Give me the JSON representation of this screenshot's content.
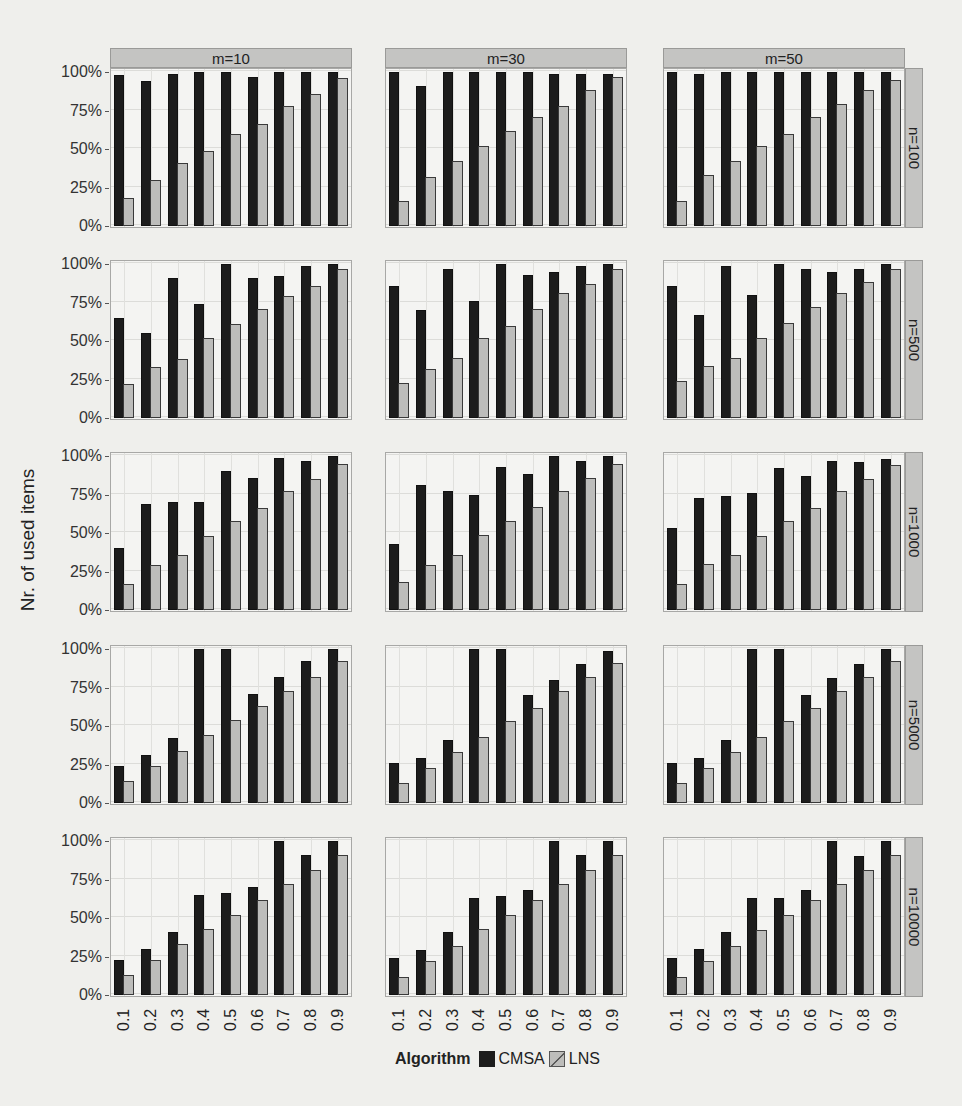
{
  "chart_data": {
    "type": "bar",
    "layout": "facet_grid",
    "title": "",
    "xlabel": "",
    "ylabel": "Nr. of used items",
    "y_tick_labels": [
      "0%",
      "25%",
      "50%",
      "75%",
      "100%"
    ],
    "ylim": [
      0,
      100
    ],
    "categories": [
      "0.1",
      "0.2",
      "0.3",
      "0.4",
      "0.5",
      "0.6",
      "0.7",
      "0.8",
      "0.9"
    ],
    "facet_columns": [
      "m=10",
      "m=30",
      "m=50"
    ],
    "facet_rows": [
      "n=100",
      "n=500",
      "n=1000",
      "n=5000",
      "n=10000"
    ],
    "legend": {
      "title": "Algorithm",
      "entries": [
        "CMSA",
        "LNS"
      ],
      "position": "bottom"
    },
    "grid": true,
    "panels": [
      {
        "row": "n=100",
        "col": "m=10",
        "series": [
          {
            "name": "CMSA",
            "values": [
              98,
              94,
              99,
              100,
              100,
              97,
              100,
              100,
              100
            ]
          },
          {
            "name": "LNS",
            "values": [
              18,
              30,
              41,
              49,
              60,
              66,
              78,
              86,
              96
            ]
          }
        ]
      },
      {
        "row": "n=100",
        "col": "m=30",
        "series": [
          {
            "name": "CMSA",
            "values": [
              100,
              91,
              100,
              100,
              100,
              100,
              99,
              99,
              99
            ]
          },
          {
            "name": "LNS",
            "values": [
              16,
              32,
              42,
              52,
              62,
              71,
              78,
              88,
              97
            ]
          }
        ]
      },
      {
        "row": "n=100",
        "col": "m=50",
        "series": [
          {
            "name": "CMSA",
            "values": [
              100,
              99,
              100,
              100,
              100,
              100,
              100,
              100,
              100
            ]
          },
          {
            "name": "LNS",
            "values": [
              16,
              33,
              42,
              52,
              60,
              71,
              79,
              88,
              95
            ]
          }
        ]
      },
      {
        "row": "n=500",
        "col": "m=10",
        "series": [
          {
            "name": "CMSA",
            "values": [
              65,
              55,
              91,
              74,
              100,
              91,
              92,
              99,
              100
            ]
          },
          {
            "name": "LNS",
            "values": [
              22,
              33,
              38,
              52,
              61,
              71,
              79,
              86,
              97
            ]
          }
        ]
      },
      {
        "row": "n=500",
        "col": "m=30",
        "series": [
          {
            "name": "CMSA",
            "values": [
              86,
              70,
              97,
              76,
              100,
              93,
              95,
              99,
              100
            ]
          },
          {
            "name": "LNS",
            "values": [
              23,
              32,
              39,
              52,
              60,
              71,
              81,
              87,
              97
            ]
          }
        ]
      },
      {
        "row": "n=500",
        "col": "m=50",
        "series": [
          {
            "name": "CMSA",
            "values": [
              86,
              67,
              99,
              80,
              100,
              97,
              95,
              97,
              100
            ]
          },
          {
            "name": "LNS",
            "values": [
              24,
              34,
              39,
              52,
              62,
              72,
              81,
              88,
              97
            ]
          }
        ]
      },
      {
        "row": "n=1000",
        "col": "m=10",
        "series": [
          {
            "name": "CMSA",
            "values": [
              40,
              69,
              70,
              70,
              90,
              86,
              99,
              97,
              100
            ]
          },
          {
            "name": "LNS",
            "values": [
              17,
              29,
              36,
              48,
              58,
              66,
              77,
              85,
              95
            ]
          }
        ]
      },
      {
        "row": "n=1000",
        "col": "m=30",
        "series": [
          {
            "name": "CMSA",
            "values": [
              43,
              81,
              77,
              75,
              93,
              88,
              100,
              97,
              100
            ]
          },
          {
            "name": "LNS",
            "values": [
              18,
              29,
              36,
              49,
              58,
              67,
              77,
              86,
              95
            ]
          }
        ]
      },
      {
        "row": "n=1000",
        "col": "m=50",
        "series": [
          {
            "name": "CMSA",
            "values": [
              53,
              73,
              74,
              76,
              92,
              87,
              97,
              96,
              98
            ]
          },
          {
            "name": "LNS",
            "values": [
              17,
              30,
              36,
              48,
              58,
              66,
              77,
              85,
              94
            ]
          }
        ]
      },
      {
        "row": "n=5000",
        "col": "m=10",
        "series": [
          {
            "name": "CMSA",
            "values": [
              24,
              31,
              42,
              100,
              100,
              71,
              82,
              92,
              100
            ]
          },
          {
            "name": "LNS",
            "values": [
              14,
              24,
              34,
              44,
              54,
              63,
              73,
              82,
              92
            ]
          }
        ]
      },
      {
        "row": "n=5000",
        "col": "m=30",
        "series": [
          {
            "name": "CMSA",
            "values": [
              26,
              29,
              41,
              100,
              100,
              70,
              80,
              90,
              99
            ]
          },
          {
            "name": "LNS",
            "values": [
              13,
              23,
              33,
              43,
              53,
              62,
              73,
              82,
              91
            ]
          }
        ]
      },
      {
        "row": "n=5000",
        "col": "m=50",
        "series": [
          {
            "name": "CMSA",
            "values": [
              26,
              29,
              41,
              100,
              100,
              70,
              81,
              90,
              100
            ]
          },
          {
            "name": "LNS",
            "values": [
              13,
              23,
              33,
              43,
              53,
              62,
              73,
              82,
              92
            ]
          }
        ]
      },
      {
        "row": "n=10000",
        "col": "m=10",
        "series": [
          {
            "name": "CMSA",
            "values": [
              23,
              30,
              41,
              65,
              66,
              70,
              100,
              91,
              100
            ]
          },
          {
            "name": "LNS",
            "values": [
              13,
              23,
              33,
              43,
              52,
              62,
              72,
              81,
              91
            ]
          }
        ]
      },
      {
        "row": "n=10000",
        "col": "m=30",
        "series": [
          {
            "name": "CMSA",
            "values": [
              24,
              29,
              41,
              63,
              64,
              68,
              100,
              91,
              100
            ]
          },
          {
            "name": "LNS",
            "values": [
              12,
              22,
              32,
              43,
              52,
              62,
              72,
              81,
              91
            ]
          }
        ]
      },
      {
        "row": "n=10000",
        "col": "m=50",
        "series": [
          {
            "name": "CMSA",
            "values": [
              24,
              30,
              41,
              63,
              63,
              68,
              100,
              90,
              100
            ]
          },
          {
            "name": "LNS",
            "values": [
              12,
              22,
              32,
              42,
              52,
              62,
              72,
              81,
              91
            ]
          }
        ]
      }
    ]
  },
  "colors": {
    "cmsa": "#1c1c1c",
    "lns": "#bdbdbb",
    "strip": "#c4c4c2",
    "panel_bg": "#f4f4f2"
  }
}
